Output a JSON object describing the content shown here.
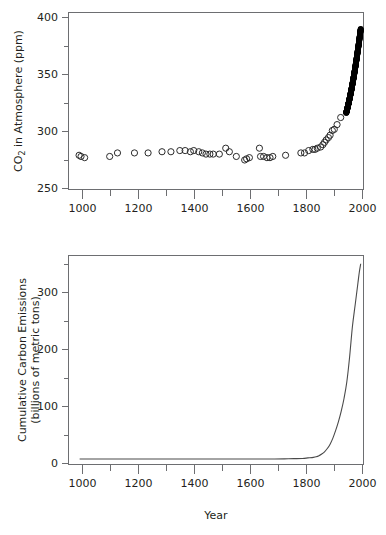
{
  "figure": {
    "background_color": "#ffffff",
    "axis_color": "#6d6e71",
    "marker_color": "#2b2b2b",
    "modern_band_color": "#000000",
    "shared_xlabel": "Year"
  },
  "panels": {
    "top": {
      "ylabel_main": "CO",
      "ylabel_sub": "2",
      "ylabel_rest": " in Atmosphere (ppm)",
      "ylabel_full": "CO2 in Atmosphere (ppm)",
      "y_ticklabels": [
        "400",
        "350",
        "300",
        "250"
      ],
      "y_minor_values": [
        375,
        325,
        275
      ],
      "x_ticklabels": [
        "1000",
        "1200",
        "1400",
        "1600",
        "1800",
        "2000"
      ],
      "x_minor_values": [
        1100,
        1300,
        1500,
        1700,
        1900
      ]
    },
    "bottom": {
      "ylabel_line1": "Cumulative Carbon Emissions",
      "ylabel_line2": "(billions of metric tons)",
      "y_ticklabels": [
        "300",
        "200",
        "100",
        "0"
      ],
      "y_minor_values": [
        350,
        250,
        150,
        50
      ],
      "x_ticklabels": [
        "1000",
        "1200",
        "1400",
        "1600",
        "1800",
        "2000"
      ],
      "x_minor_values": [
        1100,
        1300,
        1500,
        1700,
        1900
      ]
    }
  },
  "chart_data": [
    {
      "type": "scatter",
      "panel": "top",
      "title": "",
      "xlabel": "Year",
      "ylabel": "CO2 in Atmosphere (ppm)",
      "xlim": [
        960,
        2020
      ],
      "ylim": [
        250,
        400
      ],
      "grid": false,
      "legend": "none",
      "xticks": [
        1000,
        1200,
        1400,
        1600,
        1800,
        2000
      ],
      "yticks": [
        250,
        300,
        350,
        400
      ],
      "series": [
        {
          "name": "Ice core CO2 (open circles)",
          "marker": "open-circle",
          "x": [
            998,
            1005,
            1018,
            1108,
            1136,
            1197,
            1246,
            1296,
            1328,
            1360,
            1379,
            1398,
            1410,
            1428,
            1441,
            1454,
            1468,
            1480,
            1502,
            1525,
            1538,
            1563,
            1593,
            1600,
            1610,
            1646,
            1650,
            1661,
            1673,
            1684,
            1694,
            1740,
            1795,
            1808,
            1823,
            1838,
            1846,
            1854,
            1866,
            1874,
            1880,
            1886,
            1894,
            1900,
            1908,
            1915,
            1925,
            1938
          ],
          "y": [
            279,
            278,
            277,
            278,
            281,
            281,
            281,
            282,
            282,
            283,
            283,
            282,
            283,
            282,
            281,
            280,
            280,
            280,
            280,
            285,
            282,
            278,
            275,
            276,
            277,
            285,
            278,
            278,
            277,
            277,
            278,
            279,
            281,
            281,
            283,
            284,
            284,
            285,
            286,
            288,
            290,
            292,
            294,
            296,
            300,
            301,
            305,
            311,
            317
          ],
          "count": 48
        },
        {
          "name": "Mauna Loa CO2 (dense filled band)",
          "marker": "filled-dense",
          "x_range": [
            1958,
            2010
          ],
          "y_range": [
            315,
            386
          ],
          "description": "Dense near-vertical band of filled points rising from about 315 ppm in 1958 to about 386 ppm in 2010"
        }
      ]
    },
    {
      "type": "line",
      "panel": "bottom",
      "title": "",
      "xlabel": "Year",
      "ylabel": "Cumulative Carbon Emissions (billions of metric tons)",
      "xlim": [
        960,
        2020
      ],
      "ylim": [
        -10,
        370
      ],
      "grid": false,
      "legend": "none",
      "xticks": [
        1000,
        1200,
        1400,
        1600,
        1800,
        2000
      ],
      "yticks": [
        0,
        100,
        200,
        300
      ],
      "series": [
        {
          "name": "Cumulative carbon emissions",
          "x": [
            1000,
            1100,
            1200,
            1300,
            1400,
            1500,
            1600,
            1700,
            1750,
            1800,
            1820,
            1840,
            1850,
            1860,
            1870,
            1880,
            1890,
            1900,
            1910,
            1920,
            1930,
            1940,
            1950,
            1960,
            1970,
            1980,
            1990,
            2000,
            2005,
            2010
          ],
          "y": [
            0,
            0,
            0,
            0,
            0,
            0,
            0,
            0,
            0.5,
            1,
            2,
            3,
            4,
            6,
            9,
            13,
            19,
            27,
            38,
            52,
            68,
            87,
            110,
            140,
            185,
            240,
            280,
            320,
            340,
            355
          ]
        }
      ]
    }
  ]
}
